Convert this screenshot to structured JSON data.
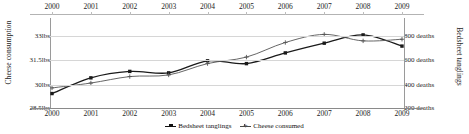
{
  "chart_data": {
    "type": "line",
    "title": "",
    "xlabel": "",
    "ylabel": "Cheese consumption",
    "y2label": "Bedsheet tanglings",
    "categories": [
      "2000",
      "2001",
      "2002",
      "2003",
      "2004",
      "2005",
      "2006",
      "2007",
      "2008",
      "2009"
    ],
    "x_axis": {
      "top_ticks": [
        "2000",
        "2001",
        "2002",
        "2003",
        "2004",
        "2005",
        "2006",
        "2007",
        "2008",
        "2009"
      ],
      "bottom_ticks": [
        "2000",
        "2001",
        "2002",
        "2003",
        "2004",
        "2005",
        "2006",
        "2007",
        "2008",
        "2009"
      ]
    },
    "y_axis_left": {
      "ticks": [
        "33lbs",
        "31.5lbs",
        "30lbs",
        "28.5lbs"
      ],
      "tick_values": [
        33,
        31.5,
        30,
        28.5
      ],
      "ylim": [
        28.5,
        33
      ],
      "unit": "lbs"
    },
    "y_axis_right": {
      "ticks": [
        "800 deaths",
        "600 deaths",
        "400 deaths",
        "200 deaths"
      ],
      "tick_values": [
        800,
        600,
        400,
        200
      ],
      "ylim": [
        200,
        800
      ],
      "unit": "deaths"
    },
    "grid": true,
    "legend_position": "bottom",
    "series": [
      {
        "name": "Bedsheet tanglings",
        "axis": "right",
        "unit": "deaths",
        "marker": "filled-square",
        "values": [
          327,
          456,
          509,
          497,
          596,
          573,
          661,
          741,
          809,
          717
        ]
      },
      {
        "name": "Cheese consumed",
        "axis": "left",
        "unit": "lbs",
        "marker": "plus",
        "values": [
          29.8,
          30.1,
          30.5,
          30.6,
          31.3,
          31.7,
          32.6,
          33.1,
          32.7,
          32.8
        ]
      }
    ]
  },
  "legend": {
    "items": [
      {
        "label": "Bedsheet tanglings"
      },
      {
        "label": "Cheese consumed"
      }
    ]
  }
}
